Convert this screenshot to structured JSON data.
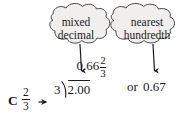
{
  "figure": {
    "label": "C",
    "source_fraction": {
      "numerator": "2",
      "denominator": "3"
    },
    "arrow_glyph": "right-arrow",
    "long_division": {
      "divisor": "3",
      "dividend": "2.00",
      "quotient_whole": "0.66",
      "quotient_fraction": {
        "numerator": "2",
        "denominator": "3"
      }
    },
    "conjunction": "or",
    "rounded_result": "0.67"
  },
  "callouts": [
    {
      "id": "mixed-decimal",
      "line1": "mixed",
      "line2": "decimal",
      "points_to": "0.66 2/3"
    },
    {
      "id": "nearest-hundredth",
      "line1": "nearest",
      "line2": "hundredth",
      "points_to": "0.67"
    }
  ],
  "colors": {
    "background": "#ffffff",
    "ink": "#1a1a1a",
    "cloud_fill": "#f0efee",
    "cloud_stroke": "#4a4a4a"
  }
}
